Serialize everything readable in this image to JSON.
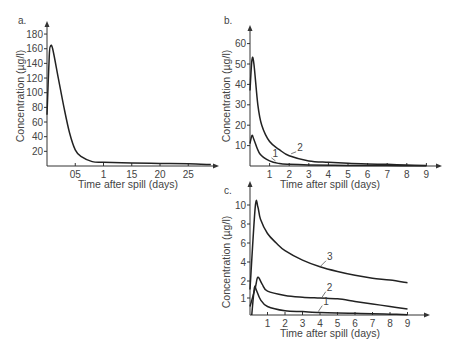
{
  "chart_data": [
    {
      "panel": "a.",
      "type": "line",
      "xlabel": "Time after spill (days)",
      "ylabel": "Concentration (µg/l)",
      "x_ticks": [
        "05",
        "1",
        "15",
        "20",
        "25"
      ],
      "x_tick_values": [
        0.5,
        1.0,
        1.5,
        2.0,
        2.5
      ],
      "y_ticks": [
        "20",
        "40",
        "60",
        "80",
        "100",
        "120",
        "140",
        "160",
        "180"
      ],
      "ylim": [
        0,
        180
      ],
      "xlim": [
        0,
        2.9
      ],
      "series": [
        {
          "name": "",
          "x": [
            0,
            0.04,
            0.06,
            0.1,
            0.2,
            0.3,
            0.4,
            0.5,
            0.6,
            0.8,
            1.0,
            1.5,
            2.0,
            2.5,
            2.9
          ],
          "y": [
            70,
            150,
            163,
            160,
            120,
            80,
            45,
            22,
            13,
            6,
            5,
            4,
            3.5,
            3,
            2
          ]
        }
      ]
    },
    {
      "panel": "b.",
      "type": "line",
      "xlabel": "Time after spill (days)",
      "ylabel": "Concentration (µg/l)",
      "x_ticks": [
        "1",
        "2",
        "3",
        "4",
        "5",
        "6",
        "7",
        "8",
        "9"
      ],
      "y_ticks": [
        "10",
        "20",
        "30",
        "40",
        "50",
        "60"
      ],
      "ylim": [
        0,
        60
      ],
      "xlim": [
        0,
        9
      ],
      "series": [
        {
          "name": "1",
          "x": [
            0,
            0.1,
            0.2,
            0.5,
            1.0,
            1.5,
            2,
            3,
            5,
            7,
            9
          ],
          "y": [
            11,
            15,
            13,
            6,
            2.5,
            1.2,
            0.8,
            0.5,
            0.3,
            0.2,
            0.1
          ]
        },
        {
          "name": "2",
          "x": [
            0,
            0.1,
            0.2,
            0.4,
            0.6,
            1.0,
            1.5,
            2,
            3,
            4,
            5,
            6,
            7,
            8,
            9
          ],
          "y": [
            37,
            52,
            50,
            30,
            20,
            12,
            8,
            5,
            2.5,
            1.8,
            1.3,
            1.0,
            0.8,
            0.5,
            0.3
          ]
        }
      ]
    },
    {
      "panel": "c.",
      "type": "line",
      "xlabel": "Time after spill (days)",
      "ylabel": "Concentration (µg/l)",
      "x_ticks": [
        "1",
        "2",
        "3",
        "4",
        "5",
        "6",
        "7",
        "8",
        "9"
      ],
      "y_ticks": [
        "1",
        "2",
        "4",
        "6",
        "8",
        "10"
      ],
      "ylim": [
        0,
        10
      ],
      "xlim": [
        0,
        9
      ],
      "series": [
        {
          "name": "1",
          "x": [
            0.1,
            0.25,
            0.35,
            0.6,
            1,
            2,
            3,
            4,
            5,
            6,
            7,
            8,
            9
          ],
          "y": [
            0,
            1.6,
            1.5,
            0.9,
            0.5,
            0.25,
            0.2,
            0.15,
            0.12,
            0.1,
            0.08,
            0.05,
            0.02
          ]
        },
        {
          "name": "2",
          "x": [
            0,
            0.3,
            0.45,
            0.7,
            1,
            2,
            3,
            4,
            5,
            6,
            7,
            8,
            9
          ],
          "y": [
            0.5,
            1.6,
            2.4,
            1.8,
            1.4,
            1.15,
            1.05,
            1.0,
            0.95,
            0.8,
            0.65,
            0.5,
            0.35
          ]
        },
        {
          "name": "3",
          "x": [
            0,
            0.3,
            0.45,
            0.6,
            1,
            1.5,
            2,
            3,
            4,
            5,
            6,
            7,
            8,
            9
          ],
          "y": [
            1.5,
            9.8,
            9.8,
            8.5,
            7.0,
            6.0,
            5.2,
            4.2,
            3.5,
            3.0,
            2.6,
            2.3,
            2.1,
            1.9
          ]
        }
      ]
    }
  ]
}
